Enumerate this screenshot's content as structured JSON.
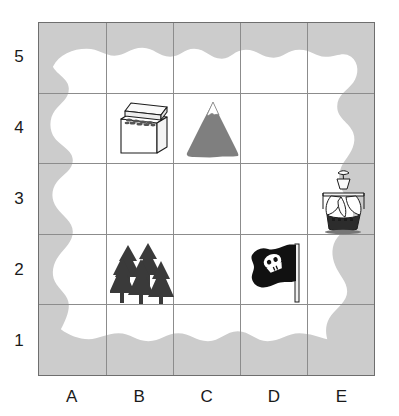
{
  "figure": {
    "name": "treasure-island-grid-map"
  },
  "grid": {
    "columns": [
      "A",
      "B",
      "C",
      "D",
      "E"
    ],
    "rows": [
      "5",
      "4",
      "3",
      "2",
      "1"
    ],
    "row_order_top_to_bottom": [
      "5",
      "4",
      "3",
      "2",
      "1"
    ],
    "column_count": 5,
    "row_count": 5,
    "line_color": "#8c8c8c",
    "border_color": "#6e6e6e"
  },
  "colors": {
    "water": "#cccccc",
    "land": "#ffffff",
    "mountain": "#7f7f7f",
    "forest": "#3a3a3a",
    "flag": "#111111",
    "ink": "#1a1a1a",
    "page_background": "#ffffff"
  },
  "features": [
    {
      "id": "treasure-chest",
      "label": "Treasure chest",
      "icon": "treasure-chest-icon",
      "column": "B",
      "row": "4",
      "coordinate": "B4"
    },
    {
      "id": "mountain",
      "label": "Mountain",
      "icon": "mountain-icon",
      "column": "C",
      "row": "4",
      "coordinate": "C4"
    },
    {
      "id": "ship",
      "label": "Sailing ship",
      "icon": "ship-icon",
      "column": "E",
      "row": "3",
      "coordinate": "E3"
    },
    {
      "id": "forest",
      "label": "Forest",
      "icon": "forest-icon",
      "column": "B",
      "row": "2",
      "coordinate": "B2"
    },
    {
      "id": "flag",
      "label": "Pirate flag",
      "icon": "pirate-flag-icon",
      "column": "D",
      "row": "2",
      "coordinate": "D2"
    }
  ],
  "axis": {
    "column_labels": [
      {
        "text": "A"
      },
      {
        "text": "B"
      },
      {
        "text": "C"
      },
      {
        "text": "D"
      },
      {
        "text": "E"
      }
    ],
    "row_labels": [
      {
        "text": "5"
      },
      {
        "text": "4"
      },
      {
        "text": "3"
      },
      {
        "text": "2"
      },
      {
        "text": "1"
      }
    ]
  }
}
